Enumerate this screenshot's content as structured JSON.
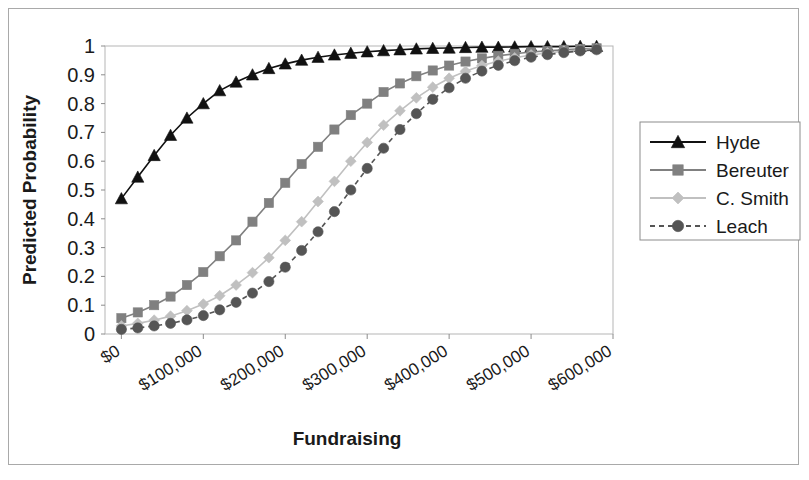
{
  "chart_data": {
    "type": "line",
    "title": "",
    "xlabel": "Fundraising",
    "ylabel": "Predicted Probability",
    "xlim": [
      -20000,
      600000
    ],
    "ylim": [
      0,
      1
    ],
    "grid": false,
    "legend_position": "right",
    "x_tick_labels": [
      "$0",
      "$100,000",
      "$200,000",
      "$300,000",
      "$400,000",
      "$500,000",
      "$600,000"
    ],
    "x_tick_values": [
      0,
      100000,
      200000,
      300000,
      400000,
      500000,
      600000
    ],
    "y_tick_labels": [
      "0",
      "0.1",
      "0.2",
      "0.3",
      "0.4",
      "0.5",
      "0.6",
      "0.7",
      "0.8",
      "0.9",
      "1"
    ],
    "y_tick_values": [
      0,
      0.1,
      0.2,
      0.3,
      0.4,
      0.5,
      0.6,
      0.7,
      0.8,
      0.9,
      1
    ],
    "x": [
      0,
      20000,
      40000,
      60000,
      80000,
      100000,
      120000,
      140000,
      160000,
      180000,
      200000,
      220000,
      240000,
      260000,
      280000,
      300000,
      320000,
      340000,
      360000,
      380000,
      400000,
      420000,
      440000,
      460000,
      480000,
      500000,
      520000,
      540000,
      560000,
      580000
    ],
    "series": [
      {
        "name": "Hyde",
        "marker": "triangle",
        "color": "#111111",
        "line_style": "solid",
        "values": [
          0.47,
          0.545,
          0.62,
          0.69,
          0.75,
          0.8,
          0.845,
          0.875,
          0.9,
          0.922,
          0.938,
          0.951,
          0.961,
          0.969,
          0.975,
          0.98,
          0.984,
          0.987,
          0.99,
          0.992,
          0.993,
          0.995,
          0.996,
          0.996,
          0.997,
          0.998,
          0.998,
          0.998,
          0.999,
          0.999
        ]
      },
      {
        "name": "Bereuter",
        "marker": "square",
        "color": "#808080",
        "line_style": "solid",
        "values": [
          0.055,
          0.075,
          0.1,
          0.13,
          0.17,
          0.215,
          0.27,
          0.325,
          0.39,
          0.455,
          0.525,
          0.59,
          0.65,
          0.71,
          0.76,
          0.8,
          0.84,
          0.87,
          0.895,
          0.915,
          0.932,
          0.946,
          0.957,
          0.966,
          0.973,
          0.979,
          0.983,
          0.987,
          0.99,
          0.992
        ]
      },
      {
        "name": "C. Smith",
        "marker": "diamond",
        "color": "#c0c0c0",
        "line_style": "solid",
        "values": [
          0.028,
          0.037,
          0.048,
          0.062,
          0.081,
          0.104,
          0.133,
          0.17,
          0.213,
          0.265,
          0.325,
          0.39,
          0.46,
          0.53,
          0.6,
          0.665,
          0.725,
          0.775,
          0.82,
          0.857,
          0.888,
          0.912,
          0.932,
          0.947,
          0.959,
          0.969,
          0.976,
          0.982,
          0.986,
          0.99
        ]
      },
      {
        "name": "Leach",
        "marker": "circle",
        "color": "#555555",
        "line_style": "dashed",
        "values": [
          0.016,
          0.021,
          0.028,
          0.037,
          0.049,
          0.064,
          0.084,
          0.11,
          0.142,
          0.182,
          0.232,
          0.29,
          0.355,
          0.425,
          0.5,
          0.575,
          0.645,
          0.71,
          0.765,
          0.815,
          0.855,
          0.888,
          0.913,
          0.933,
          0.949,
          0.961,
          0.97,
          0.977,
          0.983,
          0.987
        ]
      }
    ]
  },
  "legend": {
    "entries": [
      "Hyde",
      "Bereuter",
      "C. Smith",
      "Leach"
    ]
  }
}
